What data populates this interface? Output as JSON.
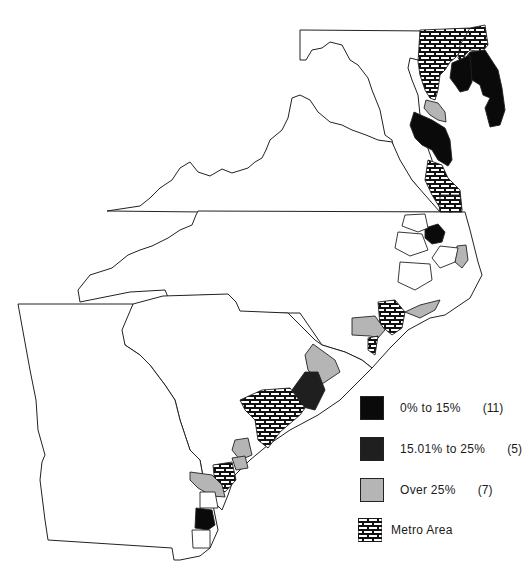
{
  "map": {
    "region": "Mid-Atlantic and South Atlantic coastal counties (Maryland, Delaware, Virginia, North Carolina, South Carolina, Georgia)",
    "colors": {
      "black": "#0a0a0a",
      "dark": "#1f1f1f",
      "gray": "#b5b5b5",
      "white": "#ffffff",
      "outline": "#222222"
    }
  },
  "legend": {
    "items": [
      {
        "label": "0% to 15%",
        "count": "(11)",
        "fill": "#0a0a0a",
        "pattern": "solid-black"
      },
      {
        "label": "15.01% to 25%",
        "count": "(5)",
        "fill": "#1f1f1f",
        "pattern": "solid-dark"
      },
      {
        "label": "Over 25%",
        "count": "(7)",
        "fill": "#b5b5b5",
        "pattern": "solid-gray"
      },
      {
        "label": "Metro Area",
        "count": "",
        "fill": "brick",
        "pattern": "brick-hatch"
      }
    ]
  }
}
